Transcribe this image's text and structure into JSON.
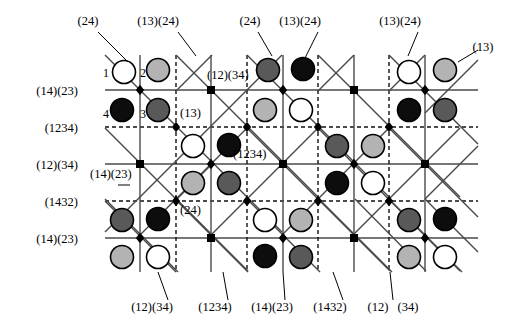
{
  "figure": {
    "type": "lattice-diagram",
    "width": 510,
    "height": 326,
    "colors": {
      "line": "#4a4a4a",
      "node": "#000000",
      "white_disc": "#ffffff",
      "light_gray_disc": "#b3b3b3",
      "dark_gray_disc": "#595959",
      "black_disc": "#0d0d0d",
      "stroke": "#000000"
    }
  },
  "left_labels": [
    {
      "text": "(14)(23)",
      "x": 78,
      "y": 92,
      "style": "solid"
    },
    {
      "text": "(1234)",
      "x": 78,
      "y": 129,
      "style": "dashed"
    },
    {
      "text": "(12)(34)",
      "x": 78,
      "y": 166,
      "style": "solid"
    },
    {
      "text": "(1432)",
      "x": 78,
      "y": 203,
      "style": "dashed"
    },
    {
      "text": "(14)(23)",
      "x": 78,
      "y": 240,
      "style": "solid"
    }
  ],
  "top_labels": [
    {
      "text": "(24)",
      "x": 88,
      "y": 22
    },
    {
      "text": "(13)(24)",
      "x": 158,
      "y": 22
    },
    {
      "text": "(24)",
      "x": 250,
      "y": 22
    },
    {
      "text": "(13)(24)",
      "x": 300,
      "y": 22
    },
    {
      "text": "(13)(24)",
      "x": 400,
      "y": 22
    },
    {
      "text": "(13)",
      "x": 483,
      "y": 48
    }
  ],
  "bottom_labels": [
    {
      "text": "(12)(34)",
      "x": 152,
      "y": 308
    },
    {
      "text": "(1234)",
      "x": 215,
      "y": 308
    },
    {
      "text": "(14)(23)",
      "x": 272,
      "y": 308
    },
    {
      "text": "(1432)",
      "x": 330,
      "y": 308
    },
    {
      "text": "(12)",
      "x": 378,
      "y": 308
    },
    {
      "text": "(34)",
      "x": 408,
      "y": 308
    }
  ],
  "inner_labels": [
    {
      "text": "(12)(34)",
      "x": 207,
      "y": 76
    },
    {
      "text": "(13)",
      "x": 180,
      "y": 114
    },
    {
      "text": "(1234)",
      "x": 233,
      "y": 155
    },
    {
      "text": "(14)(23)",
      "x": 90,
      "y": 175
    },
    {
      "text": "(24)",
      "x": 180,
      "y": 211
    }
  ],
  "vertex_numbers": [
    {
      "text": "1",
      "x": 103,
      "y": 73
    },
    {
      "text": "2",
      "x": 140,
      "y": 73
    },
    {
      "text": "4",
      "x": 103,
      "y": 114
    },
    {
      "text": "3",
      "x": 140,
      "y": 114
    }
  ],
  "leader_lines": [
    {
      "from": [
        98,
        32
      ],
      "to": [
        128,
        62
      ]
    },
    {
      "from": [
        178,
        32
      ],
      "to": [
        196,
        56
      ]
    },
    {
      "from": [
        258,
        32
      ],
      "to": [
        272,
        56
      ]
    },
    {
      "from": [
        318,
        32
      ],
      "to": [
        305,
        58
      ]
    },
    {
      "from": [
        418,
        32
      ],
      "to": [
        408,
        56
      ]
    },
    {
      "from": [
        478,
        50
      ],
      "to": [
        458,
        62
      ]
    },
    {
      "from": [
        168,
        300
      ],
      "to": [
        158,
        272
      ]
    },
    {
      "from": [
        228,
        300
      ],
      "to": [
        223,
        272
      ]
    },
    {
      "from": [
        285,
        300
      ],
      "to": [
        283,
        272
      ]
    },
    {
      "from": [
        343,
        300
      ],
      "to": [
        333,
        272
      ]
    },
    {
      "from": [
        393,
        300
      ],
      "to": [
        390,
        272
      ]
    },
    {
      "from": [
        118,
        185
      ],
      "to": [
        130,
        185
      ]
    }
  ],
  "grid": {
    "x_nodes": [
      140,
      211,
      283,
      354,
      425
    ],
    "y_rows": [
      90,
      127,
      164,
      201,
      238
    ],
    "x_min": 105,
    "x_max": 478,
    "dashed_verticals": [
      176,
      247,
      318,
      389
    ],
    "solid_verticals": [
      140,
      211,
      283,
      354,
      425
    ],
    "dashed_horizontals": [
      127,
      201
    ],
    "solid_horizontals": [
      90,
      164,
      238
    ]
  },
  "discs": [
    {
      "cx": 124,
      "cy": 72,
      "fill": "white"
    },
    {
      "cx": 158,
      "cy": 70,
      "fill": "light"
    },
    {
      "cx": 268,
      "cy": 70,
      "fill": "dark"
    },
    {
      "cx": 303,
      "cy": 69,
      "fill": "black"
    },
    {
      "cx": 409,
      "cy": 72,
      "fill": "white"
    },
    {
      "cx": 445,
      "cy": 70,
      "fill": "light"
    },
    {
      "cx": 122,
      "cy": 110,
      "fill": "black"
    },
    {
      "cx": 158,
      "cy": 110,
      "fill": "dark"
    },
    {
      "cx": 265,
      "cy": 110,
      "fill": "light"
    },
    {
      "cx": 301,
      "cy": 110,
      "fill": "white"
    },
    {
      "cx": 409,
      "cy": 110,
      "fill": "black"
    },
    {
      "cx": 445,
      "cy": 110,
      "fill": "dark"
    },
    {
      "cx": 193,
      "cy": 146,
      "fill": "white"
    },
    {
      "cx": 229,
      "cy": 145,
      "fill": "black"
    },
    {
      "cx": 337,
      "cy": 146,
      "fill": "dark"
    },
    {
      "cx": 373,
      "cy": 146,
      "fill": "light"
    },
    {
      "cx": 193,
      "cy": 183,
      "fill": "light"
    },
    {
      "cx": 229,
      "cy": 183,
      "fill": "dark"
    },
    {
      "cx": 337,
      "cy": 183,
      "fill": "black"
    },
    {
      "cx": 373,
      "cy": 183,
      "fill": "white"
    },
    {
      "cx": 122,
      "cy": 220,
      "fill": "dark"
    },
    {
      "cx": 158,
      "cy": 219,
      "fill": "black"
    },
    {
      "cx": 265,
      "cy": 220,
      "fill": "white"
    },
    {
      "cx": 301,
      "cy": 220,
      "fill": "light"
    },
    {
      "cx": 409,
      "cy": 220,
      "fill": "dark"
    },
    {
      "cx": 445,
      "cy": 219,
      "fill": "black"
    },
    {
      "cx": 122,
      "cy": 257,
      "fill": "light"
    },
    {
      "cx": 158,
      "cy": 257,
      "fill": "white"
    },
    {
      "cx": 265,
      "cy": 256,
      "fill": "black"
    },
    {
      "cx": 301,
      "cy": 257,
      "fill": "dark"
    },
    {
      "cx": 409,
      "cy": 257,
      "fill": "light"
    },
    {
      "cx": 445,
      "cy": 257,
      "fill": "white"
    }
  ],
  "nodes": [
    {
      "x": 140,
      "y": 90,
      "shape": "diamond"
    },
    {
      "x": 211,
      "y": 90,
      "shape": "square"
    },
    {
      "x": 283,
      "y": 90,
      "shape": "diamond"
    },
    {
      "x": 354,
      "y": 90,
      "shape": "square"
    },
    {
      "x": 425,
      "y": 90,
      "shape": "diamond"
    },
    {
      "x": 176,
      "y": 127,
      "shape": "diamond"
    },
    {
      "x": 247,
      "y": 127,
      "shape": "diamond"
    },
    {
      "x": 318,
      "y": 127,
      "shape": "diamond"
    },
    {
      "x": 389,
      "y": 127,
      "shape": "diamond"
    },
    {
      "x": 140,
      "y": 164,
      "shape": "square"
    },
    {
      "x": 211,
      "y": 164,
      "shape": "diamond"
    },
    {
      "x": 283,
      "y": 164,
      "shape": "square"
    },
    {
      "x": 354,
      "y": 164,
      "shape": "diamond"
    },
    {
      "x": 425,
      "y": 164,
      "shape": "square"
    },
    {
      "x": 176,
      "y": 201,
      "shape": "diamond"
    },
    {
      "x": 247,
      "y": 201,
      "shape": "diamond"
    },
    {
      "x": 318,
      "y": 201,
      "shape": "diamond"
    },
    {
      "x": 389,
      "y": 201,
      "shape": "diamond"
    },
    {
      "x": 140,
      "y": 238,
      "shape": "diamond"
    },
    {
      "x": 211,
      "y": 238,
      "shape": "square"
    },
    {
      "x": 283,
      "y": 238,
      "shape": "diamond"
    },
    {
      "x": 354,
      "y": 238,
      "shape": "square"
    },
    {
      "x": 425,
      "y": 238,
      "shape": "diamond"
    }
  ],
  "diagonals": [
    {
      "x1": 105,
      "y1": 55,
      "x2": 282,
      "y2": 232,
      "dir": "down"
    },
    {
      "x1": 176,
      "y1": 55,
      "x2": 318,
      "y2": 197,
      "dir": "down"
    },
    {
      "x1": 247,
      "y1": 55,
      "x2": 389,
      "y2": 197,
      "dir": "down"
    },
    {
      "x1": 318,
      "y1": 55,
      "x2": 460,
      "y2": 197,
      "dir": "down"
    },
    {
      "x1": 389,
      "y1": 55,
      "x2": 478,
      "y2": 144,
      "dir": "down"
    },
    {
      "x1": 105,
      "y1": 128,
      "x2": 215,
      "y2": 238,
      "dir": "down"
    },
    {
      "x1": 105,
      "y1": 199,
      "x2": 178,
      "y2": 272,
      "dir": "down"
    },
    {
      "x1": 247,
      "y1": 128,
      "x2": 390,
      "y2": 271,
      "dir": "down"
    },
    {
      "x1": 318,
      "y1": 128,
      "x2": 460,
      "y2": 271,
      "dir": "down"
    },
    {
      "x1": 389,
      "y1": 128,
      "x2": 478,
      "y2": 217,
      "dir": "down"
    },
    {
      "x1": 176,
      "y1": 199,
      "x2": 248,
      "y2": 271,
      "dir": "down"
    },
    {
      "x1": 355,
      "y1": 199,
      "x2": 426,
      "y2": 271,
      "dir": "down"
    },
    {
      "x1": 425,
      "y1": 199,
      "x2": 478,
      "y2": 252,
      "dir": "down"
    },
    {
      "x1": 282,
      "y1": 55,
      "x2": 105,
      "y2": 232,
      "dir": "up"
    },
    {
      "x1": 212,
      "y1": 55,
      "x2": 176,
      "y2": 91,
      "dir": "up"
    },
    {
      "x1": 354,
      "y1": 55,
      "x2": 318,
      "y2": 91,
      "dir": "up"
    },
    {
      "x1": 425,
      "y1": 55,
      "x2": 389,
      "y2": 91,
      "dir": "up"
    },
    {
      "x1": 478,
      "y1": 60,
      "x2": 425,
      "y2": 113,
      "dir": "up"
    },
    {
      "x1": 247,
      "y1": 128,
      "x2": 140,
      "y2": 235,
      "dir": "up"
    },
    {
      "x1": 318,
      "y1": 128,
      "x2": 211,
      "y2": 235,
      "dir": "up"
    },
    {
      "x1": 389,
      "y1": 128,
      "x2": 283,
      "y2": 234,
      "dir": "up"
    },
    {
      "x1": 460,
      "y1": 128,
      "x2": 354,
      "y2": 234,
      "dir": "up"
    },
    {
      "x1": 478,
      "y1": 146,
      "x2": 425,
      "y2": 199,
      "dir": "up"
    },
    {
      "x1": 211,
      "y1": 165,
      "x2": 176,
      "y2": 200,
      "dir": "up"
    },
    {
      "x1": 176,
      "y1": 272,
      "x2": 105,
      "y2": 201,
      "dir": "up"
    },
    {
      "x1": 248,
      "y1": 272,
      "x2": 176,
      "y2": 200,
      "dir": "up"
    },
    {
      "x1": 320,
      "y1": 272,
      "x2": 247,
      "y2": 199,
      "dir": "up"
    },
    {
      "x1": 392,
      "y1": 272,
      "x2": 318,
      "y2": 198,
      "dir": "up"
    },
    {
      "x1": 462,
      "y1": 272,
      "x2": 389,
      "y2": 199,
      "dir": "up"
    }
  ]
}
